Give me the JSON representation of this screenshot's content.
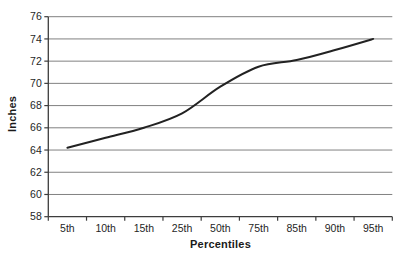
{
  "figure": {
    "background": "#ffffff",
    "text_color": "#1a1a1a"
  },
  "chart_data": {
    "type": "line",
    "title": "",
    "xlabel": "Percentiles",
    "ylabel": "Inches",
    "categories": [
      "5th",
      "10th",
      "15th",
      "25th",
      "50th",
      "75th",
      "85th",
      "90th",
      "95th"
    ],
    "values": [
      64.2,
      65.1,
      66.0,
      67.3,
      69.7,
      71.5,
      72.1,
      73.0,
      74.0
    ],
    "ylim": [
      58,
      76
    ],
    "y_ticks": [
      58,
      60,
      62,
      64,
      66,
      68,
      70,
      72,
      74,
      76
    ],
    "grid": true,
    "legend": false,
    "smooth": true,
    "line_color": "#222222",
    "grid_color": "#818181",
    "axis_color": "#3d3d3d",
    "tick_label_color": "#1f1f1f"
  }
}
